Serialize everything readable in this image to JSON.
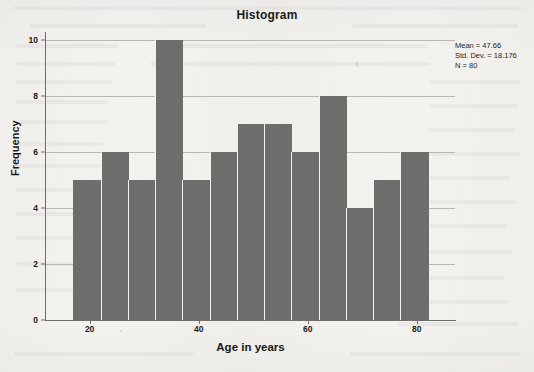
{
  "chart_data": {
    "type": "bar",
    "title": "Histogram",
    "xlabel": "Age in years",
    "ylabel": "Frequency",
    "categories": [
      "17-22",
      "22-27",
      "27-32",
      "32-37",
      "37-42",
      "42-47",
      "47-52",
      "52-57",
      "57-62",
      "62-67",
      "67-72",
      "72-77",
      "77-82"
    ],
    "bin_centers": [
      19.5,
      24.5,
      29.5,
      34.5,
      39.5,
      44.5,
      49.5,
      54.5,
      59.5,
      64.5,
      69.5,
      74.5,
      79.5
    ],
    "bin_edges": [
      17,
      22,
      27,
      32,
      37,
      42,
      47,
      52,
      57,
      62,
      67,
      72,
      77,
      82
    ],
    "values": [
      5,
      6,
      5,
      10,
      5,
      6,
      7,
      7,
      6,
      8,
      4,
      5,
      6
    ],
    "xlim": [
      12,
      87
    ],
    "ylim": [
      0,
      10
    ],
    "yticks": [
      0,
      2,
      4,
      6,
      8,
      10
    ],
    "xticks": [
      20,
      40,
      60,
      80
    ],
    "grid": true,
    "legend": "none",
    "bar_color": "#6e6d6b",
    "gridline_color": "#b9b8b4",
    "axis_color": "#6f6e6b",
    "background_color": "#f3f2ef"
  },
  "stats": {
    "mean": "Mean = 47.66",
    "std_dev": "Std. Dev. = 18.176",
    "n": "N = 80"
  }
}
